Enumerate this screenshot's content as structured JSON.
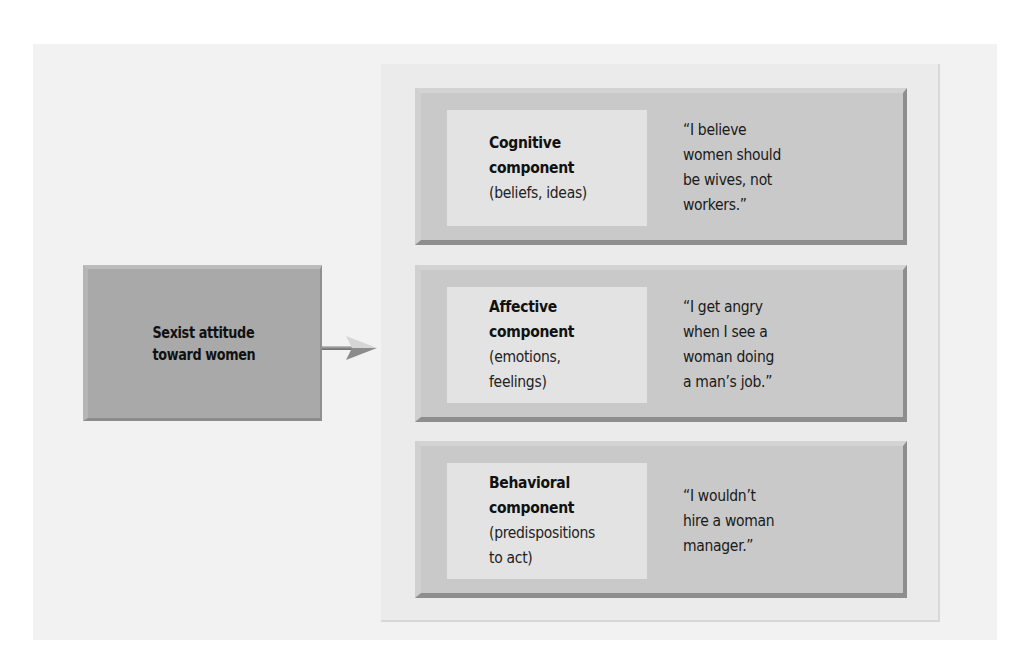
{
  "diagram": {
    "source": {
      "label": "Sexist attitude\ntoward women"
    },
    "arrow": {
      "icon": "right-arrow-icon",
      "direction": "right"
    },
    "components": [
      {
        "title": "Cognitive\ncomponent",
        "description": "(beliefs, ideas)",
        "quote": "“I believe\nwomen should\nbe wives, not\nworkers.”"
      },
      {
        "title": "Affective\ncomponent",
        "description": "(emotions,\nfeelings)",
        "quote": "“I get angry\nwhen I see a\nwoman doing\na man’s job.”"
      },
      {
        "title": "Behavioral\ncomponent",
        "description": "(predispositions\nto act)",
        "quote": "“I wouldn’t\nhire a woman\nmanager.”"
      }
    ],
    "colors": {
      "outer_background": "#f2f2f2",
      "panel_background": "#ebebeb",
      "source_box": "#a9a9a9",
      "component_box": "#c9c9c9",
      "inner_label": "#e3e3e3",
      "text": "#111111"
    }
  }
}
